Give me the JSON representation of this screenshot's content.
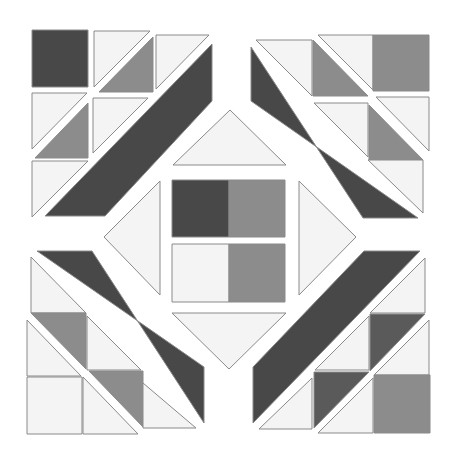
{
  "colors": {
    "background": "#ffffff",
    "dark": "#484848",
    "darkmid": "#5a5a5a",
    "mid": "#8c8c8c",
    "light": "#f4f4f4",
    "outline": "#8a8a8a"
  },
  "pieces": [
    {
      "group": "top-left",
      "shape": "square",
      "tone": "dark",
      "points": "32,30 88,30 88,87 32,87"
    },
    {
      "group": "top-left",
      "shape": "triangle",
      "tone": "light",
      "points": "94,31 150,31 94,87"
    },
    {
      "group": "top-left",
      "shape": "triangle",
      "tone": "mid",
      "points": "153,37 153,92 99,92"
    },
    {
      "group": "top-left",
      "shape": "triangle",
      "tone": "light",
      "points": "156,35 209,35 156,89"
    },
    {
      "group": "top-left",
      "shape": "triangle",
      "tone": "light",
      "points": "32,93 87,93 32,149"
    },
    {
      "group": "top-left",
      "shape": "triangle",
      "tone": "mid",
      "points": "88,103 88,158 35,158"
    },
    {
      "group": "top-left",
      "shape": "triangle",
      "tone": "light",
      "points": "93,98 148,98 93,153"
    },
    {
      "group": "top-left",
      "shape": "triangle",
      "tone": "light",
      "points": "32,161 88,161 32,217"
    },
    {
      "group": "top-left",
      "shape": "band",
      "tone": "dark",
      "points": "212,44 212,101 105,216 45,216"
    },
    {
      "group": "top-right",
      "shape": "triangle",
      "tone": "light",
      "points": "256,40 312,40 312,96"
    },
    {
      "group": "top-right",
      "shape": "triangle",
      "tone": "mid",
      "points": "313,40 313,96 368,96"
    },
    {
      "group": "top-right",
      "shape": "triangle",
      "tone": "light",
      "points": "318,35 373,35 373,90"
    },
    {
      "group": "top-right",
      "shape": "square",
      "tone": "mid",
      "points": "373,35 429,35 429,91 373,91"
    },
    {
      "group": "top-right",
      "shape": "triangle",
      "tone": "light",
      "points": "314,103 368,103 368,157"
    },
    {
      "group": "top-right",
      "shape": "triangle",
      "tone": "mid",
      "points": "369,105 369,160 423,160"
    },
    {
      "group": "top-right",
      "shape": "triangle",
      "tone": "light",
      "points": "376,97 429,97 429,151"
    },
    {
      "group": "top-right",
      "shape": "triangle",
      "tone": "light",
      "points": "368,160 423,160 423,213"
    },
    {
      "group": "top-right",
      "shape": "band",
      "tone": "dark",
      "points": "251,47 363,218 418,218 251,101"
    },
    {
      "group": "center",
      "shape": "triangle",
      "tone": "light",
      "points": "230,110 286,165 173,165"
    },
    {
      "group": "center",
      "shape": "square",
      "tone": "dark",
      "points": "172,180 229,180 229,237 172,237"
    },
    {
      "group": "center",
      "shape": "square",
      "tone": "mid",
      "points": "229,180 285,180 285,237 229,237"
    },
    {
      "group": "center",
      "shape": "square",
      "tone": "light",
      "points": "172,244 229,244 229,302 172,302"
    },
    {
      "group": "center",
      "shape": "square",
      "tone": "mid",
      "points": "229,244 285,244 285,302 229,302"
    },
    {
      "group": "center",
      "shape": "triangle",
      "tone": "light",
      "points": "104,237 160,181 160,295"
    },
    {
      "group": "center",
      "shape": "triangle",
      "tone": "light",
      "points": "356,237 299,181 299,295"
    },
    {
      "group": "center",
      "shape": "triangle",
      "tone": "light",
      "points": "172,313 286,313 229,369"
    },
    {
      "group": "bottom-left",
      "shape": "band",
      "tone": "dark",
      "points": "37,251 92,251 204,423 204,367"
    },
    {
      "group": "bottom-left",
      "shape": "triangle",
      "tone": "light",
      "points": "31,257 31,313 86,313"
    },
    {
      "group": "bottom-left",
      "shape": "triangle",
      "tone": "mid",
      "points": "31,313 86,313 86,369"
    },
    {
      "group": "bottom-left",
      "shape": "triangle",
      "tone": "light",
      "points": "87,316 87,370 141,370"
    },
    {
      "group": "bottom-left",
      "shape": "triangle",
      "tone": "light",
      "points": "27,320 27,376 81,376"
    },
    {
      "group": "bottom-left",
      "shape": "triangle",
      "tone": "mid",
      "points": "89,371 143,371 143,427"
    },
    {
      "group": "bottom-left",
      "shape": "triangle",
      "tone": "light",
      "points": "143,383 143,428 196,428"
    },
    {
      "group": "bottom-left",
      "shape": "square",
      "tone": "light",
      "points": "27,377 82,377 82,434 27,434"
    },
    {
      "group": "bottom-left",
      "shape": "triangle",
      "tone": "light",
      "points": "83,377 83,434 138,434"
    },
    {
      "group": "bottom-right",
      "shape": "band",
      "tone": "dark",
      "points": "364,251 420,251 253,423 253,367"
    },
    {
      "group": "bottom-right",
      "shape": "triangle",
      "tone": "light",
      "points": "425,258 425,313 370,313"
    },
    {
      "group": "bottom-right",
      "shape": "triangle",
      "tone": "darkmid",
      "points": "370,314 425,314 370,371"
    },
    {
      "group": "bottom-right",
      "shape": "triangle",
      "tone": "light",
      "points": "369,316 369,370 315,370"
    },
    {
      "group": "bottom-right",
      "shape": "triangle",
      "tone": "light",
      "points": "429,320 429,375 374,375"
    },
    {
      "group": "bottom-right",
      "shape": "triangle",
      "tone": "darkmid",
      "points": "314,372 369,372 314,428"
    },
    {
      "group": "bottom-right",
      "shape": "triangle",
      "tone": "light",
      "points": "312,378 312,429 259,429"
    },
    {
      "group": "bottom-right",
      "shape": "square",
      "tone": "mid",
      "points": "374,375 430,375 430,433 374,433"
    },
    {
      "group": "bottom-right",
      "shape": "triangle",
      "tone": "light",
      "points": "373,378 373,433 318,433"
    }
  ]
}
